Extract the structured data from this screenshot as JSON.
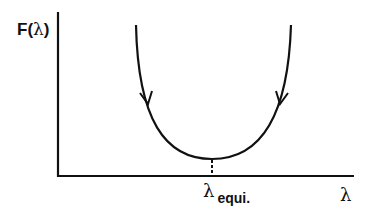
{
  "diagram": {
    "y_axis_label_prefix": "F(",
    "y_axis_label_symbol": "λ",
    "y_axis_label_suffix": ")",
    "x_axis_label": "λ",
    "min_label_symbol": "λ",
    "min_label_subscript": "equi.",
    "curve": "U-shaped (parabola-like) curve with downward arrows on both branches converging at minimum",
    "colors": {
      "stroke": "#111111",
      "background": "#ffffff"
    }
  }
}
